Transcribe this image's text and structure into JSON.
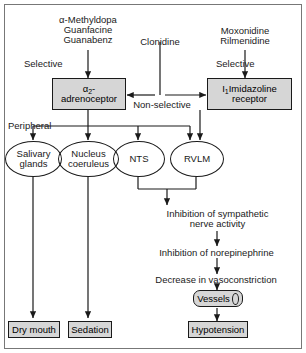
{
  "figure": {
    "colors": {
      "node_fill": "#d6d6d6",
      "stroke": "#1a1a1a",
      "frame": "#777777",
      "background": "#ffffff",
      "text": "#000000"
    }
  },
  "drugs": {
    "alpha2_agonists": "α-Methyldopa\nGuanfacine\nGuanabenz",
    "mixed_agonist": "Clonidine",
    "imidazoline_agonists": "Moxonidine\nRilmenidine"
  },
  "edge_labels": {
    "selective_left": "Selective",
    "selective_right": "Selective",
    "non_selective": "Non-selective",
    "peripheral": "Peripheral"
  },
  "receptors": {
    "alpha2": {
      "line1": "α",
      "sub": "2",
      "line1_tail": "-",
      "line2": "adrenoceptor"
    },
    "imidazoline": {
      "line1": "I",
      "sub": "1",
      "line1_tail": " Imidazoline",
      "line2": "receptor"
    }
  },
  "targets": [
    {
      "label": "Salivary\nglands"
    },
    {
      "label": "Nucleus\ncoeruleus"
    },
    {
      "label": "NTS"
    },
    {
      "label": "RVLM"
    }
  ],
  "cascade": [
    "Inhibition of sympathetic\nnerve activity",
    "Inhibition of norepinephrine",
    "Decrease in vasoconstriction"
  ],
  "vessels": {
    "label": "Vessels"
  },
  "outcomes": [
    {
      "label": "Dry mouth"
    },
    {
      "label": "Sedation"
    },
    {
      "label": "Hypotension"
    }
  ]
}
